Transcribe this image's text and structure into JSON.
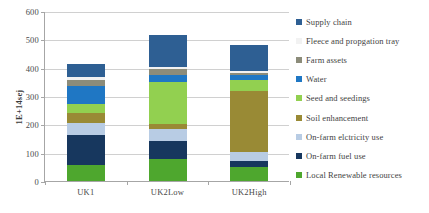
{
  "chart_data": {
    "type": "bar",
    "title": "",
    "xlabel": "",
    "ylabel": "1E+14sej",
    "ylim": [
      0,
      600
    ],
    "ytick_labels": [
      "0",
      "100",
      "200",
      "300",
      "400",
      "500",
      "600"
    ],
    "yticks": [
      0,
      100,
      200,
      300,
      400,
      500,
      600
    ],
    "grid": true,
    "stacked": true,
    "legend_position": "right",
    "categories": [
      "UK1",
      "UK2Low",
      "UK2High"
    ],
    "series": [
      {
        "name": "Local Renewable resources",
        "color": "#4EA72E",
        "values": [
          57,
          78,
          48
        ]
      },
      {
        "name": "On-farm fuel use",
        "color": "#17375E",
        "values": [
          106,
          64,
          23
        ]
      },
      {
        "name": "On-farm elctricity use",
        "color": "#B8CCE4",
        "values": [
          42,
          43,
          30
        ]
      },
      {
        "name": "Soil enhancement",
        "color": "#998A35",
        "values": [
          36,
          18,
          218
        ]
      },
      {
        "name": "Seed and seedings",
        "color": "#92D050",
        "values": [
          32,
          145,
          38
        ]
      },
      {
        "name": "Water",
        "color": "#1F77C4",
        "values": [
          61,
          25,
          18
        ]
      },
      {
        "name": "Farm assets",
        "color": "#8C8C7A",
        "values": [
          22,
          22,
          8
        ]
      },
      {
        "name": "Fleece  and propgation tray",
        "color": "#F2F2F2",
        "values": [
          10,
          7,
          5
        ]
      },
      {
        "name": "Supply chain",
        "color": "#2E5F93",
        "values": [
          46,
          113,
          91
        ]
      }
    ],
    "totals": [
      412,
      515,
      479
    ],
    "legend_entries": [
      {
        "label": "Supply chain",
        "color": "#2E5F93"
      },
      {
        "label": "Fleece  and propgation tray",
        "color": "#F2F2F2"
      },
      {
        "label": "Farm assets",
        "color": "#8C8C7A"
      },
      {
        "label": "Water",
        "color": "#1F77C4"
      },
      {
        "label": "Seed and seedings",
        "color": "#92D050"
      },
      {
        "label": "Soil enhancement",
        "color": "#998A35"
      },
      {
        "label": "On-farm elctricity use",
        "color": "#B8CCE4"
      },
      {
        "label": "On-farm fuel use",
        "color": "#17375E"
      },
      {
        "label": "Local Renewable resources",
        "color": "#4EA72E"
      }
    ]
  }
}
